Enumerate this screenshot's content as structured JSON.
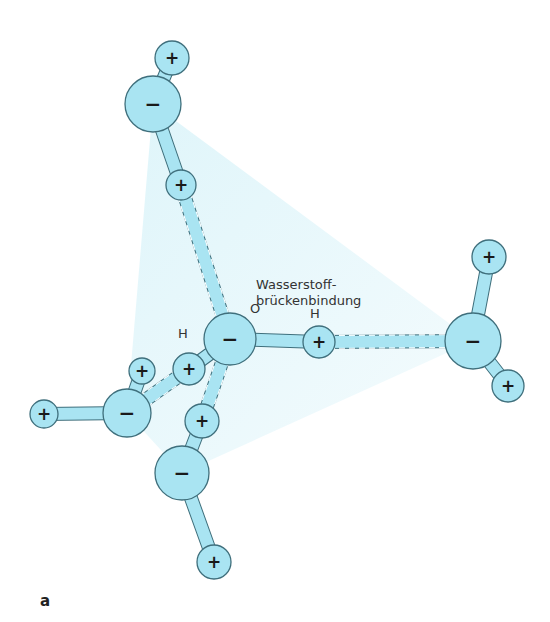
{
  "figure": {
    "label": "a",
    "annotation": {
      "line1": "Wasserstoff-",
      "line2": "brückenbindung"
    },
    "atom_labels": {
      "oxygen": "O",
      "hydrogen_left": "H",
      "hydrogen_right": "H"
    },
    "signs": {
      "positive": "+",
      "negative": "−"
    },
    "colors": {
      "atom_fill": "#a9e4f2",
      "atom_stroke": "#3f6f7c",
      "tetra_fill": "#e6f7fb",
      "bond_stroke": "#3f6f7c"
    }
  },
  "atoms": [
    {
      "id": "O-center",
      "charge": "negative",
      "x": 230,
      "y": 339,
      "r": 26
    },
    {
      "id": "H-center-right",
      "charge": "positive",
      "x": 319,
      "y": 342,
      "r": 16
    },
    {
      "id": "H-center-left",
      "charge": "positive",
      "x": 189,
      "y": 369,
      "r": 16
    },
    {
      "id": "O-top",
      "charge": "negative",
      "x": 153,
      "y": 104,
      "r": 28
    },
    {
      "id": "H-top",
      "charge": "positive",
      "x": 172,
      "y": 58,
      "r": 17
    },
    {
      "id": "H-top-lower",
      "charge": "positive",
      "x": 181,
      "y": 185,
      "r": 15
    },
    {
      "id": "O-right",
      "charge": "negative",
      "x": 473,
      "y": 341,
      "r": 28
    },
    {
      "id": "H-right-top",
      "charge": "positive",
      "x": 489,
      "y": 257,
      "r": 17
    },
    {
      "id": "H-right-bottom",
      "charge": "positive",
      "x": 508,
      "y": 386,
      "r": 16
    },
    {
      "id": "O-left",
      "charge": "negative",
      "x": 127,
      "y": 413,
      "r": 24
    },
    {
      "id": "H-left-top",
      "charge": "positive",
      "x": 142,
      "y": 371,
      "r": 13
    },
    {
      "id": "H-left-far",
      "charge": "positive",
      "x": 44,
      "y": 414,
      "r": 14
    },
    {
      "id": "H-bottom-upper",
      "charge": "positive",
      "x": 202,
      "y": 421,
      "r": 17
    },
    {
      "id": "O-bottom",
      "charge": "negative",
      "x": 182,
      "y": 473,
      "r": 27
    },
    {
      "id": "H-bottom",
      "charge": "positive",
      "x": 214,
      "y": 562,
      "r": 17
    }
  ],
  "bonds": {
    "covalent": [
      [
        "O-center",
        "H-center-right"
      ],
      [
        "O-center",
        "H-center-left"
      ],
      [
        "O-top",
        "H-top"
      ],
      [
        "O-top",
        "H-top-lower"
      ],
      [
        "O-right",
        "H-right-top"
      ],
      [
        "O-right",
        "H-right-bottom"
      ],
      [
        "O-left",
        "H-left-top"
      ],
      [
        "O-left",
        "H-left-far"
      ],
      [
        "O-bottom",
        "H-bottom-upper"
      ],
      [
        "O-bottom",
        "H-bottom"
      ]
    ],
    "hydrogen": [
      [
        "H-top-lower",
        "O-center"
      ],
      [
        "H-center-right",
        "O-right"
      ],
      [
        "H-center-left",
        "O-left"
      ],
      [
        "H-bottom-upper",
        "O-center"
      ]
    ]
  }
}
